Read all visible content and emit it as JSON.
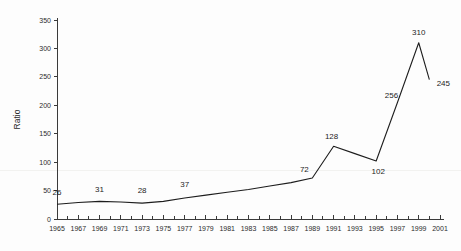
{
  "chart_data": {
    "type": "line",
    "title": "",
    "xlabel": "",
    "ylabel": "Ratio",
    "ylim": [
      0,
      350
    ],
    "xlim": [
      1965,
      2001
    ],
    "ytick_step": 50,
    "ytick_labels": [
      "0",
      "50",
      "100",
      "150",
      "200",
      "250",
      "300",
      "350"
    ],
    "ytick_values": [
      0,
      50,
      100,
      150,
      200,
      250,
      300,
      350
    ],
    "xtick_labels": [
      "1965",
      "1967",
      "1969",
      "1971",
      "1973",
      "1975",
      "1977",
      "1979",
      "1981",
      "1983",
      "1985",
      "1987",
      "1989",
      "1991",
      "1993",
      "1995",
      "1997",
      "1999",
      "2001"
    ],
    "xtick_values": [
      1965,
      1967,
      1969,
      1971,
      1973,
      1975,
      1977,
      1979,
      1981,
      1983,
      1985,
      1987,
      1989,
      1991,
      1993,
      1995,
      1997,
      1999,
      2001
    ],
    "minor_tick_interval": 1,
    "grid": false,
    "legend": false,
    "line_color": "#1d1d1d",
    "x": [
      1965,
      1967,
      1969,
      1971,
      1973,
      1975,
      1977,
      1979,
      1981,
      1983,
      1985,
      1987,
      1989,
      1991,
      1993,
      1995,
      1997,
      1999,
      2000
    ],
    "values": [
      26,
      29,
      31,
      30,
      28,
      31,
      37,
      42,
      47,
      52,
      58,
      64,
      72,
      128,
      115,
      102,
      205,
      310,
      245
    ],
    "point_labels": [
      {
        "x": 1965,
        "y": 26,
        "text": "26",
        "dx": 0,
        "dy": -9
      },
      {
        "x": 1969,
        "y": 31,
        "text": "31",
        "dx": 0,
        "dy": -9
      },
      {
        "x": 1973,
        "y": 28,
        "text": "28",
        "dx": 0,
        "dy": -10
      },
      {
        "x": 1977,
        "y": 37,
        "text": "37",
        "dx": 0,
        "dy": -11
      },
      {
        "x": 1989,
        "y": 72,
        "text": "72",
        "dx": -8,
        "dy": -6
      },
      {
        "x": 1991,
        "y": 128,
        "text": "128",
        "dx": -2,
        "dy": -7
      },
      {
        "x": 1995,
        "y": 102,
        "text": "102",
        "dx": 2,
        "dy": 13
      },
      {
        "x": 1997,
        "y": 205,
        "text": "256",
        "dx": -6,
        "dy": -4
      },
      {
        "x": 1999,
        "y": 310,
        "text": "310",
        "dx": 0,
        "dy": -8
      },
      {
        "x": 2000,
        "y": 245,
        "text": "245",
        "dx": 14,
        "dy": 6
      }
    ]
  }
}
